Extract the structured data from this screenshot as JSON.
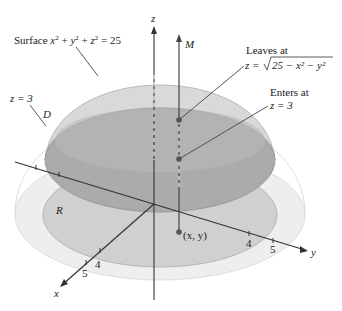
{
  "figure": {
    "surface_label": "Surface x² + y² + z² = 25",
    "surface_label_parts": {
      "prefix": "Surface ",
      "x": "x",
      "y": "y",
      "z": "z",
      "eq": " = 25"
    },
    "plane_label": "z = 3",
    "region_D": "D",
    "region_R": "R",
    "axis_z": "z",
    "axis_x": "x",
    "axis_y": "y",
    "line_label": "M",
    "point_label": "(x, y)",
    "leaves_title": "Leaves at",
    "leaves_eq_prefix": "z = ",
    "leaves_eq_radicand": "25 − x² − y²",
    "enters_title": "Enters at",
    "enters_eq": "z = 3",
    "x_ticks": [
      "4",
      "5"
    ],
    "y_ticks": [
      "4",
      "5"
    ]
  },
  "colors": {
    "dome": "#d4d4d4",
    "disk_D": "#a9a9a9",
    "disk_R": "#cfcfcf",
    "base": "#ececec",
    "line": "#333333"
  }
}
